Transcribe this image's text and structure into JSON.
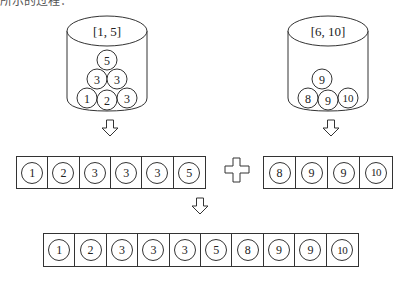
{
  "header": {
    "cutoff_text": "所示的过程："
  },
  "buckets": [
    {
      "label": "[1, 5]",
      "balls": [
        "1",
        "2",
        "3",
        "3",
        "3",
        "5"
      ]
    },
    {
      "label": "[6, 10]",
      "balls": [
        "8",
        "9",
        "9",
        "10"
      ]
    }
  ],
  "sorted_rows": [
    {
      "values": [
        "1",
        "2",
        "3",
        "3",
        "3",
        "5"
      ]
    },
    {
      "values": [
        "8",
        "9",
        "9",
        "10"
      ]
    }
  ],
  "merged_row": {
    "values": [
      "1",
      "2",
      "3",
      "3",
      "3",
      "5",
      "8",
      "9",
      "9",
      "10"
    ]
  },
  "symbols": {
    "plus": "plus-icon",
    "arrow": "down-arrow-icon"
  },
  "colors": {
    "stroke": "#333333",
    "background": "#ffffff"
  }
}
